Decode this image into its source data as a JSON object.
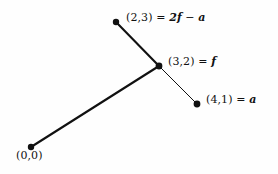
{
  "figure": {
    "name": "vector-addition-diagram",
    "background_color": "#fefefe",
    "stroke_color": "#111111",
    "point_color": "#111111"
  },
  "points": [
    {
      "id": "origin",
      "label_coords": "(0,0)",
      "equals": "",
      "expression": "",
      "x": 31,
      "y": 147,
      "radius": 3.2
    },
    {
      "id": "f",
      "label_coords": "(3,2)",
      "equals": "=",
      "expression": "f",
      "x": 159,
      "y": 66,
      "radius": 3.4
    },
    {
      "id": "2f-minus-a",
      "label_coords": "(2,3)",
      "equals": "=",
      "expression_prefix": "2",
      "expression_first": "f",
      "expression_op": "−",
      "expression_second": "a",
      "x": 116,
      "y": 22,
      "radius": 3.2
    },
    {
      "id": "a",
      "label_coords": "(4,1)",
      "equals": "=",
      "expression": "a",
      "x": 197,
      "y": 104,
      "radius": 3.4
    }
  ],
  "segments": [
    {
      "id": "origin-to-f",
      "from": "origin",
      "to": "f",
      "x1": 31,
      "y1": 147,
      "x2": 159,
      "y2": 66,
      "width": 2.1
    },
    {
      "id": "f-to-2f-minus-a",
      "from": "f",
      "to": "2f-minus-a",
      "x1": 159,
      "y1": 66,
      "x2": 116,
      "y2": 22,
      "width": 2.1
    },
    {
      "id": "f-to-a",
      "from": "f",
      "to": "a",
      "x1": 159,
      "y1": 66,
      "x2": 197,
      "y2": 104,
      "width": 1.0
    }
  ],
  "labels": {
    "top": {
      "coords": "(2,3)",
      "equals": "=",
      "prefix": "2",
      "first_var": "f",
      "operator": "−",
      "second_var": "a"
    },
    "middle": {
      "coords": "(3,2)",
      "equals": "=",
      "var": "f"
    },
    "right": {
      "coords": "(4,1)",
      "equals": "=",
      "var": "a"
    },
    "origin": {
      "coords": "(0,0)"
    }
  }
}
